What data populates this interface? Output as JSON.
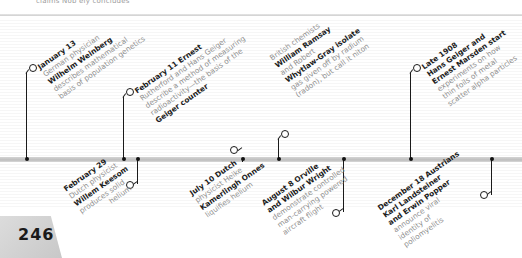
{
  "header": {
    "cut_text": "claims Nob ely concludes"
  },
  "page": {
    "number": "246"
  },
  "events_above": [
    {
      "date": "January 13",
      "lines": [
        "German physician",
        "Wilhelm Weinberg",
        "describes mathematical",
        "basis of population genetics"
      ],
      "bold_lines": [
        0,
        2
      ]
    },
    {
      "date": "February 11 Ernest",
      "lines": [
        "Rutherford and Hans Geiger",
        "describe a method of measuring",
        "radioactivity—the basis of the",
        "Geiger counter"
      ]
    },
    {
      "date": "British chemists",
      "lines": [
        "William Ramsay",
        "and Robert",
        "Whytlaw-Gray isolate",
        "gas given off by radium",
        "(radon), but call it niton"
      ]
    },
    {
      "date": "Late 1908",
      "lines": [
        "Hans Geiger and",
        "Ernest Marsden start",
        "experiments on how",
        "thin foils of metal",
        "scatter alpha particles"
      ]
    }
  ],
  "events_below": [
    {
      "date": "February 29",
      "lines": [
        "Dutch physicist",
        "Willem Keesom",
        "produces solid",
        "helium"
      ]
    },
    {
      "date": "July 10 Dutch",
      "lines": [
        "physicist Heike",
        "Kamerlingh Onnes",
        "liquifies helium"
      ]
    },
    {
      "date": "August 8 Orville",
      "lines": [
        "and Wilbur Wright",
        "demonstrate controlled",
        "man-carrying powered",
        "aircraft flight"
      ]
    },
    {
      "date": "December 18 Austrians",
      "lines": [
        "Karl Landsteiner",
        "and Erwin Popper",
        "announce viral",
        "identity of",
        "poliomyelitis"
      ]
    }
  ],
  "colors": {
    "bold_text": "#1c1c1c",
    "light_text": "#8f8f8f",
    "line": "#1a1a1a",
    "bar": "#c4c4c4",
    "page_tab": "#d2d2d2"
  }
}
